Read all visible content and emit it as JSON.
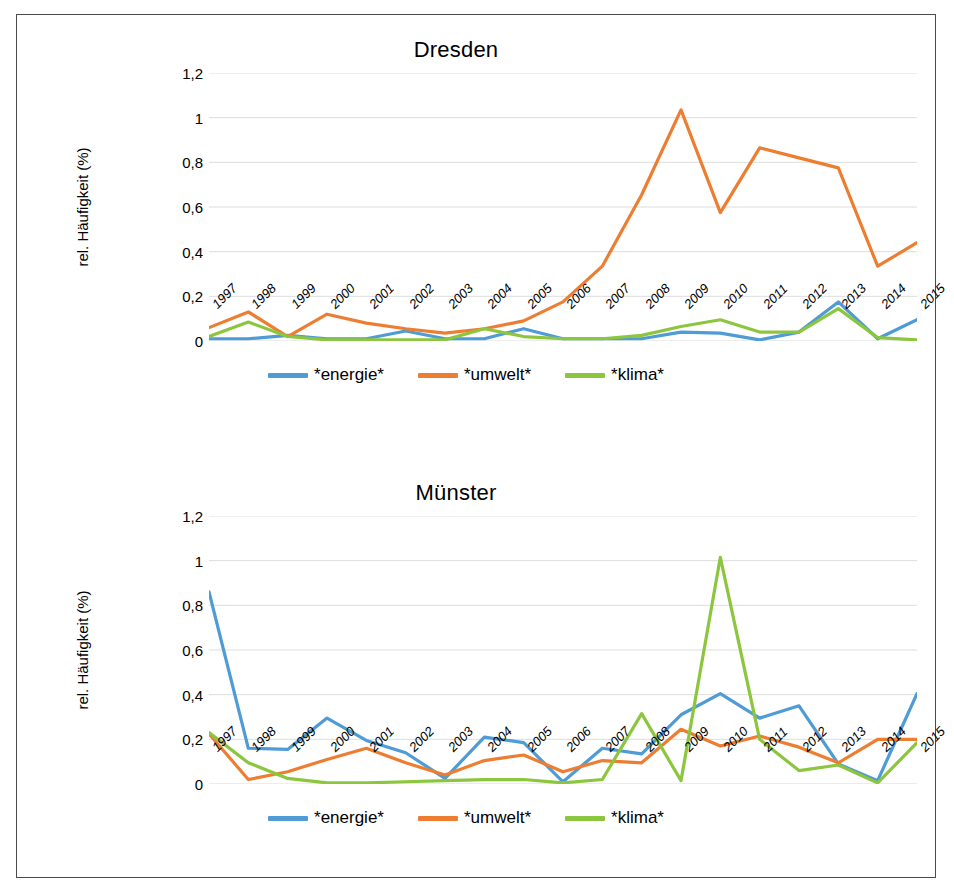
{
  "figure": {
    "background": "#ffffff",
    "border_color": "#4a4a4a"
  },
  "charts": [
    {
      "id": "dresden",
      "title": "Dresden"
    },
    {
      "id": "muenster",
      "title": "Münster"
    }
  ],
  "chart_data": [
    {
      "type": "line",
      "title": "Dresden",
      "xlabel": "",
      "ylabel": "rel. Häufigkeit (%)",
      "ylim": [
        0,
        1.2
      ],
      "yticks": [
        0,
        0.2,
        0.4,
        0.6,
        0.8,
        1,
        1.2
      ],
      "ytick_labels": [
        "0",
        "0,2",
        "0,4",
        "0,6",
        "0,8",
        "1",
        "1,2"
      ],
      "grid": true,
      "legend_position": "bottom",
      "categories": [
        "1997",
        "1998",
        "1999",
        "2000",
        "2001",
        "2002",
        "2003",
        "2004",
        "2005",
        "2006",
        "2007",
        "2008",
        "2009",
        "2010",
        "2011",
        "2012",
        "2013",
        "2014",
        "2015"
      ],
      "series": [
        {
          "name": "*energie*",
          "color": "#4E9BD5",
          "values": [
            0.01,
            0.01,
            0.025,
            0.01,
            0.01,
            0.045,
            0.01,
            0.01,
            0.055,
            0.01,
            0.01,
            0.01,
            0.04,
            0.035,
            0.005,
            0.04,
            0.175,
            0.01,
            0.095
          ]
        },
        {
          "name": "*umwelt*",
          "color": "#ED7D31",
          "values": [
            0.06,
            0.13,
            0.02,
            0.12,
            0.08,
            0.055,
            0.035,
            0.055,
            0.09,
            0.175,
            0.335,
            0.655,
            1.035,
            0.575,
            0.865,
            0.82,
            0.775,
            0.335,
            0.44
          ]
        },
        {
          "name": "*klima*",
          "color": "#8CC63E",
          "values": [
            0.02,
            0.085,
            0.02,
            0.005,
            0.005,
            0.005,
            0.005,
            0.055,
            0.02,
            0.01,
            0.01,
            0.025,
            0.065,
            0.095,
            0.04,
            0.04,
            0.145,
            0.015,
            0.005
          ]
        }
      ]
    },
    {
      "type": "line",
      "title": "Münster",
      "xlabel": "",
      "ylabel": "rel. Häufigkeit (%)",
      "ylim": [
        0,
        1.2
      ],
      "yticks": [
        0,
        0.2,
        0.4,
        0.6,
        0.8,
        1,
        1.2
      ],
      "ytick_labels": [
        "0",
        "0,2",
        "0,4",
        "0,6",
        "0,8",
        "1",
        "1,2"
      ],
      "grid": true,
      "legend_position": "bottom",
      "categories": [
        "1997",
        "1998",
        "1999",
        "2000",
        "2001",
        "2002",
        "2003",
        "2004",
        "2005",
        "2006",
        "2007",
        "2008",
        "2009",
        "2010",
        "2011",
        "2012",
        "2013",
        "2014",
        "2015"
      ],
      "series": [
        {
          "name": "*energie*",
          "color": "#4E9BD5",
          "values": [
            0.86,
            0.16,
            0.155,
            0.295,
            0.195,
            0.14,
            0.025,
            0.21,
            0.185,
            0.01,
            0.16,
            0.135,
            0.31,
            0.405,
            0.295,
            0.35,
            0.09,
            0.015,
            0.405
          ]
        },
        {
          "name": "*umwelt*",
          "color": "#ED7D31",
          "values": [
            0.225,
            0.02,
            0.055,
            0.11,
            0.16,
            0.095,
            0.04,
            0.105,
            0.13,
            0.055,
            0.105,
            0.095,
            0.245,
            0.17,
            0.215,
            0.165,
            0.095,
            0.2,
            0.2
          ]
        },
        {
          "name": "*klima*",
          "color": "#8CC63E",
          "values": [
            0.23,
            0.095,
            0.025,
            0.005,
            0.005,
            0.01,
            0.015,
            0.02,
            0.02,
            0.005,
            0.02,
            0.315,
            0.015,
            1.015,
            0.2,
            0.06,
            0.085,
            0.005,
            0.185
          ]
        }
      ]
    }
  ],
  "legend": {
    "items": [
      {
        "label": "*energie*",
        "color": "#4E9BD5"
      },
      {
        "label": "*umwelt*",
        "color": "#ED7D31"
      },
      {
        "label": "*klima*",
        "color": "#8CC63E"
      }
    ]
  },
  "axis": {
    "y_title": "rel. Häufigkeit (%)",
    "gridline_color": "#d9d9d9"
  }
}
